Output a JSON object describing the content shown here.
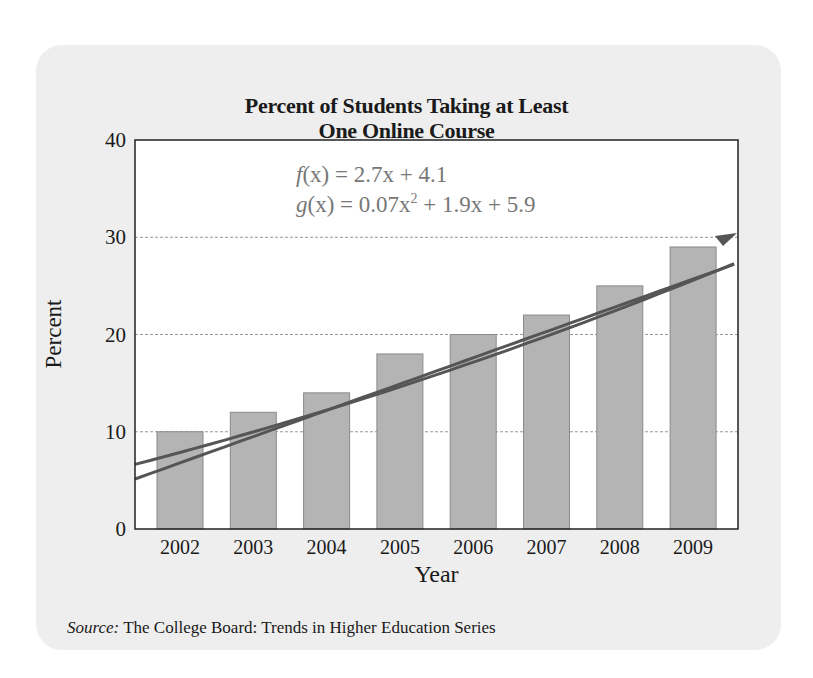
{
  "chart": {
    "title_line1": "Percent of Students Taking at Least",
    "title_line2": "One Online Course",
    "ylabel": "Percent",
    "xlabel": "Year",
    "source_label": "Source:",
    "source_text": " The College Board: Trends in Higher Education Series",
    "equations": {
      "f_lhs": "f",
      "f_rhs": "(x) = 2.7x + 4.1",
      "g_lhs": "g",
      "g_rhs_a": "(x) = 0.07x",
      "g_exp": "2",
      "g_rhs_b": " + 1.9x + 5.9"
    }
  },
  "chart_data": {
    "type": "bar",
    "title": "Percent of Students Taking at Least One Online Course",
    "xlabel": "Year",
    "ylabel": "Percent",
    "categories": [
      "2002",
      "2003",
      "2004",
      "2005",
      "2006",
      "2007",
      "2008",
      "2009"
    ],
    "values": [
      10,
      12,
      14,
      18,
      20,
      22,
      25,
      29
    ],
    "ylim": [
      0,
      40
    ],
    "yticks": [
      0,
      10,
      20,
      30,
      40
    ],
    "grid": "horizontal dashed at 10, 20, 30",
    "legend": "none",
    "overlays": [
      {
        "name": "f(x) = 2.7x + 4.1",
        "type": "line",
        "note": "linear model, x = years after 2001"
      },
      {
        "name": "g(x) = 0.07x^2 + 1.9x + 5.9",
        "type": "curve",
        "note": "quadratic model, x = years after 2001"
      }
    ],
    "source": "The College Board: Trends in Higher Education Series",
    "colors": {
      "bar": "#b4b4b4",
      "bar_edge": "#8a8a8a",
      "model_line": "#555555",
      "panel_bg": "#eeeeee",
      "plot_bg": "#ffffff"
    }
  }
}
